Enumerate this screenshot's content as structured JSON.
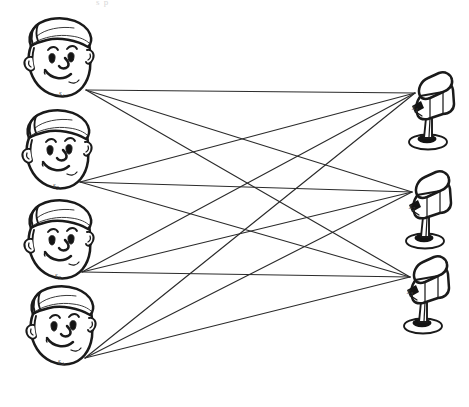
{
  "figure": {
    "title_fragment": "s p",
    "type": "source-mixture-bipartite-diagram",
    "width": 469,
    "height": 407,
    "background_color": "#ffffff",
    "line_color": "#2b2b2b",
    "ink_color": "#1a1a1a"
  },
  "sources": [
    {
      "id": "s1",
      "label": "s",
      "subscript": "1",
      "x": 86,
      "y": 90,
      "head_cx": 57,
      "head_cy": 60
    },
    {
      "id": "s2",
      "label": "s",
      "subscript": "2",
      "x": 80,
      "y": 182,
      "head_cx": 55,
      "head_cy": 152
    },
    {
      "id": "s3",
      "label": "s",
      "subscript": "3",
      "x": 82,
      "y": 272,
      "head_cx": 57,
      "head_cy": 242
    },
    {
      "id": "s4",
      "label": "s",
      "subscript": "4",
      "x": 85,
      "y": 358,
      "head_cx": 59,
      "head_cy": 328
    }
  ],
  "sensors": [
    {
      "id": "x1",
      "label": "x",
      "subscript": "1",
      "x": 415,
      "y": 93,
      "mic_cx": 428,
      "mic_cy": 110
    },
    {
      "id": "x2",
      "label": "x",
      "subscript": "2",
      "x": 412,
      "y": 192,
      "mic_cx": 425,
      "mic_cy": 209
    },
    {
      "id": "x3",
      "label": "x",
      "subscript": "3",
      "x": 410,
      "y": 277,
      "mic_cx": 423,
      "mic_cy": 294
    }
  ],
  "connections": [
    {
      "from": "s1",
      "to": "x1"
    },
    {
      "from": "s1",
      "to": "x2"
    },
    {
      "from": "s1",
      "to": "x3"
    },
    {
      "from": "s2",
      "to": "x1"
    },
    {
      "from": "s2",
      "to": "x2"
    },
    {
      "from": "s2",
      "to": "x3"
    },
    {
      "from": "s3",
      "to": "x1"
    },
    {
      "from": "s3",
      "to": "x2"
    },
    {
      "from": "s3",
      "to": "x3"
    },
    {
      "from": "s4",
      "to": "x1"
    },
    {
      "from": "s4",
      "to": "x2"
    },
    {
      "from": "s4",
      "to": "x3"
    }
  ]
}
